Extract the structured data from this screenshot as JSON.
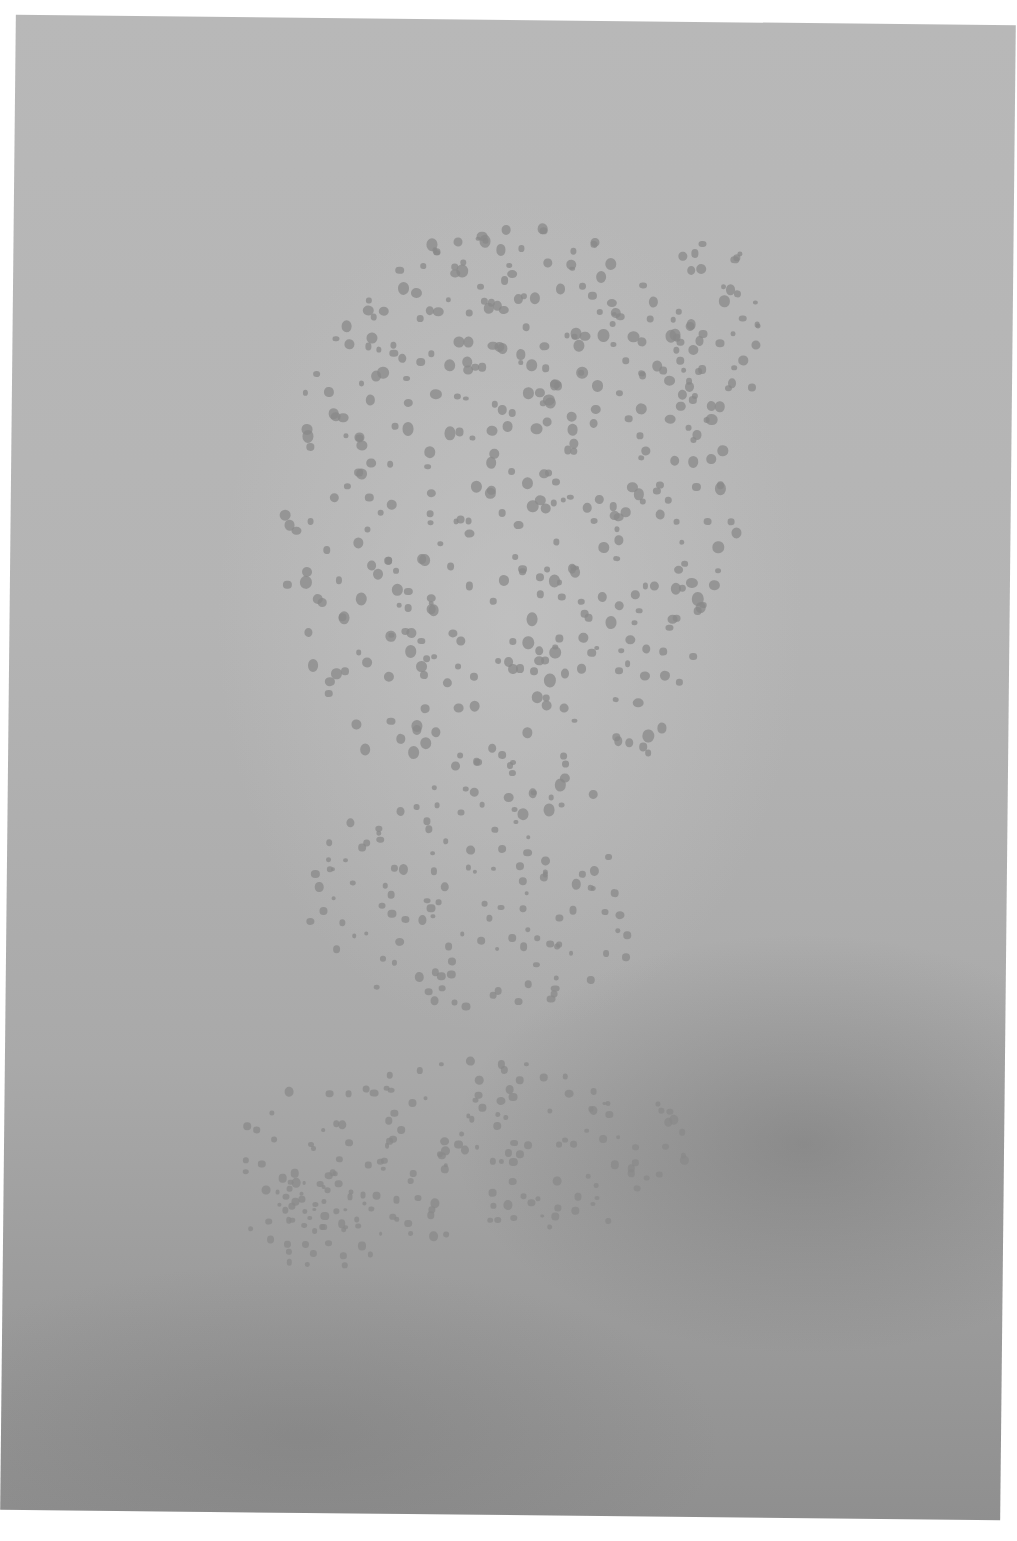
{
  "image": {
    "subject": "photograph of a paper sheet with scattered small flower-like gray marks",
    "background_colors": {
      "paper_light": "#b8b8b8",
      "paper_dark": "#8f8f8f",
      "marks": "#8a8a8a",
      "surround": "#ffffff"
    },
    "mark_clusters": [
      {
        "cx": 500,
        "cy": 520,
        "rx": 230,
        "ry": 300,
        "count": 420,
        "size": 9
      },
      {
        "cx": 700,
        "cy": 330,
        "rx": 50,
        "ry": 100,
        "count": 40,
        "size": 8
      },
      {
        "cx": 470,
        "cy": 900,
        "rx": 170,
        "ry": 120,
        "count": 120,
        "size": 7
      },
      {
        "cx": 460,
        "cy": 1150,
        "rx": 230,
        "ry": 90,
        "count": 150,
        "size": 7
      },
      {
        "cx": 320,
        "cy": 1220,
        "rx": 80,
        "ry": 50,
        "count": 50,
        "size": 6
      }
    ]
  }
}
